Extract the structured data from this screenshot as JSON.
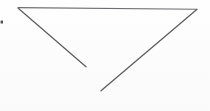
{
  "image": {
    "title": "Incomplete triangle line drawing",
    "description": "Scanned hand-drawn open triangle outline on white paper",
    "width": 210,
    "height": 111,
    "background_color": "#fefefe",
    "paper_tone_color": "#fbfbfb"
  },
  "figure": {
    "name": "open-triangle",
    "stroke_color": "#6b6b6e",
    "stroke_color_dark": "#55555a",
    "stroke_width": 1.15,
    "closed": false,
    "gap_note": "bottom apex is open; left and right diagonals do not meet",
    "vertices": {
      "top_left": {
        "x": 18,
        "y": 8
      },
      "top_right": {
        "x": 197,
        "y": 9
      },
      "left_diagonal_end": {
        "x": 86,
        "y": 67
      },
      "right_diagonal_end": {
        "x": 101,
        "y": 91
      }
    },
    "segments": [
      {
        "name": "top-edge",
        "label": "Top horizontal edge",
        "from": {
          "x": 18,
          "y": 8
        },
        "to": {
          "x": 197,
          "y": 9
        },
        "path": "M 18 7.6 L 197 9.2",
        "stroke": "#6f6f73",
        "width": 1.1
      },
      {
        "name": "left-diagonal",
        "label": "Left descending diagonal",
        "from": {
          "x": 18,
          "y": 8
        },
        "to": {
          "x": 86,
          "y": 67
        },
        "path": "M 18.2 8.2 L 86 66.8",
        "stroke": "#5c5c61",
        "width": 1.25
      },
      {
        "name": "right-diagonal",
        "label": "Right ascending diagonal",
        "from": {
          "x": 101,
          "y": 91
        },
        "to": {
          "x": 197,
          "y": 9
        },
        "path": "M 101 90.8 L 196.8 9.4",
        "stroke": "#5c5c61",
        "width": 1.25
      }
    ],
    "artifacts": [
      {
        "name": "left-edge-speck",
        "label": "Small dark speck at left margin",
        "x": 1,
        "y": 21,
        "width": 2.4,
        "height": 3.2,
        "color": "#4a4a4f"
      }
    ]
  }
}
